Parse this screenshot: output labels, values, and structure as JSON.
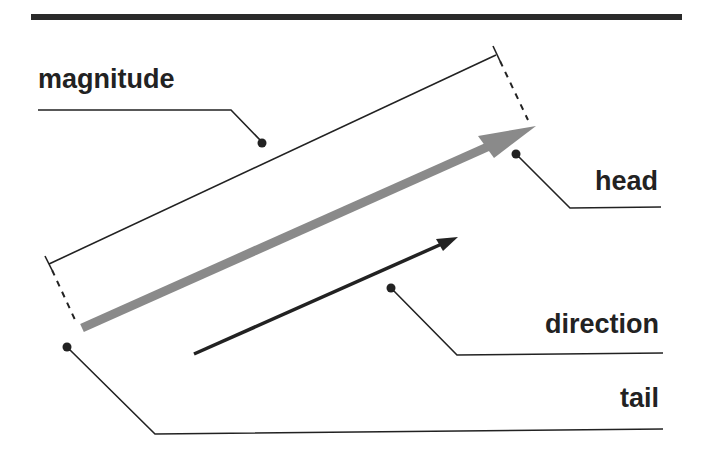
{
  "diagram": {
    "colors": {
      "ink": "#222222",
      "vector_gray": "#8a8a8a",
      "top_rule": "#2a2a2a",
      "background": "#ffffff"
    },
    "labels": {
      "magnitude": "magnitude",
      "head": "head",
      "direction": "direction",
      "tail": "tail"
    },
    "elements": {
      "main_vector": "gray vector arrow (tail to head)",
      "direction_arrow": "black direction arrow",
      "magnitude_bracket": "dimension line with dashed extension lines"
    }
  }
}
